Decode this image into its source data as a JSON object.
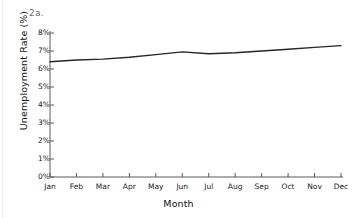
{
  "figure": {
    "panel_label": "2a.",
    "line_color": "#262626",
    "axis_color": "#5a5a5a",
    "background": "#ffffff"
  },
  "chart_data": {
    "type": "line",
    "title": "",
    "xlabel": "Month",
    "ylabel": "Unemployment Rate (%)",
    "categories": [
      "Jan",
      "Feb",
      "Mar",
      "Apr",
      "May",
      "Jun",
      "Jul",
      "Aug",
      "Sep",
      "Oct",
      "Nov",
      "Dec"
    ],
    "values": [
      6.4,
      6.5,
      6.55,
      6.65,
      6.8,
      6.95,
      6.85,
      6.9,
      7.0,
      7.1,
      7.2,
      7.3
    ],
    "series": [
      {
        "name": "Unemployment Rate",
        "values": [
          6.4,
          6.5,
          6.55,
          6.65,
          6.8,
          6.95,
          6.85,
          6.9,
          7.0,
          7.1,
          7.2,
          7.3
        ]
      }
    ],
    "ylim": [
      0,
      8
    ],
    "ytick_labels": [
      "0%",
      "1%",
      "2%",
      "3%",
      "4%",
      "5%",
      "6%",
      "7%",
      "8%"
    ],
    "ytick_values": [
      0,
      1,
      2,
      3,
      4,
      5,
      6,
      7,
      8
    ],
    "grid": false,
    "legend": "none",
    "marker": "none"
  }
}
